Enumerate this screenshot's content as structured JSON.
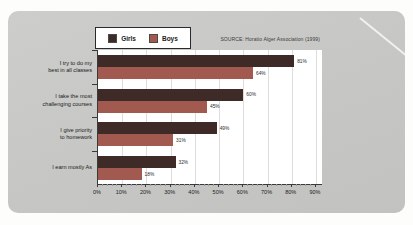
{
  "source_note": "SOURCE: Horatio Alger Association (1999)",
  "colors": {
    "card_bg": "#c6c6c4",
    "plot_bg": "#ffffff",
    "girls_bar": "#3e2b27",
    "boys_bar": "#a2594f",
    "gridline": "#dddddb"
  },
  "chart_data": {
    "type": "bar",
    "orientation": "horizontal",
    "title": "",
    "categories": [
      "I try to do my\nbest in all classes",
      "I take the most\nchallenging courses",
      "I give priority\nto homework",
      "I earn mostly As"
    ],
    "series": [
      {
        "name": "Girls",
        "color": "#3e2b27",
        "values": [
          81,
          60,
          49,
          32
        ]
      },
      {
        "name": "Boys",
        "color": "#a2594f",
        "values": [
          64,
          45,
          31,
          18
        ]
      }
    ],
    "value_suffix": "%",
    "xlabel": "",
    "ylabel": "",
    "xlim": [
      0,
      90
    ],
    "x_ticks": [
      "0%",
      "10%",
      "20%",
      "30%",
      "40%",
      "50%",
      "60%",
      "70%",
      "80%",
      "90%"
    ],
    "grid": true,
    "legend_position": "top"
  }
}
